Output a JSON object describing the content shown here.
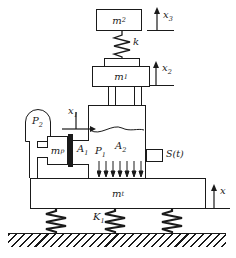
{
  "labels": {
    "top_mass": {
      "base": "m",
      "sub": "2"
    },
    "top_coord": {
      "base": "x",
      "sub": "3"
    },
    "upper_spring": "k",
    "mid_mass": {
      "base": "m",
      "sub": "1"
    },
    "mid_coord": {
      "base": "x",
      "sub": "2"
    },
    "piston_mass": {
      "base": "m",
      "sub": "p"
    },
    "piston_coord": {
      "base": "x",
      "sub": "1"
    },
    "accumulator_pressure": {
      "base": "P",
      "sub": "2"
    },
    "piston_area": {
      "base": "A",
      "sub": "1"
    },
    "chamber_pressure": {
      "base": "P",
      "sub": "1"
    },
    "chamber_area": {
      "base": "A",
      "sub": "2"
    },
    "valve_signal": "S(t)",
    "base_mass": {
      "base": "m",
      "sub": "t"
    },
    "base_coord": "x",
    "foundation_stiffness": {
      "base": "K",
      "sub": "1"
    }
  },
  "colors": {
    "line": "#1a1a1a",
    "background": "#ffffff"
  }
}
